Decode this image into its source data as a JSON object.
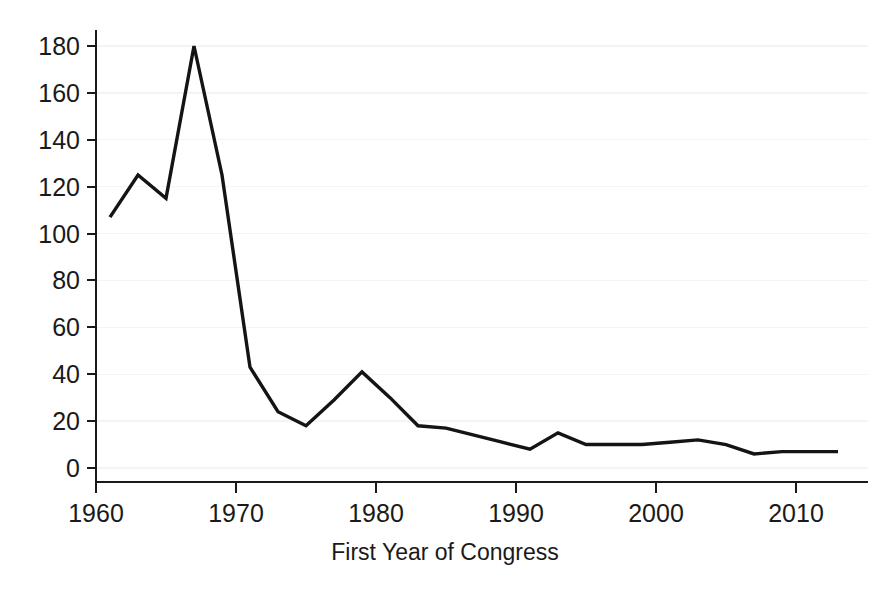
{
  "chart_data": {
    "type": "line",
    "title": "",
    "subtitle": "",
    "xlabel": "First Year of Congress",
    "ylabel": "",
    "grid": true,
    "legend": false,
    "legend_position": "none",
    "line_color": "#141414",
    "background_color": "#ffffff",
    "gridline_color": "#f4f4f4",
    "axis_color": "#1a1a1a",
    "xlim": [
      1960,
      2014
    ],
    "ylim": [
      0,
      185
    ],
    "xticks": [
      1960,
      1970,
      1980,
      1990,
      2000,
      2010
    ],
    "xtick_labels": [
      "1960",
      "1970",
      "1980",
      "1990",
      "2000",
      "2010"
    ],
    "yticks": [
      0,
      20,
      40,
      60,
      80,
      100,
      120,
      140,
      160,
      180
    ],
    "ytick_labels": [
      "0",
      "20",
      "40",
      "60",
      "80",
      "100",
      "120",
      "140",
      "160",
      "180"
    ],
    "series": [
      {
        "name": "bills",
        "x": [
          1961,
          1963,
          1965,
          1967,
          1969,
          1971,
          1973,
          1975,
          1977,
          1979,
          1981,
          1983,
          1985,
          1987,
          1989,
          1991,
          1993,
          1995,
          1997,
          1999,
          2001,
          2003,
          2005,
          2007,
          2009,
          2011,
          2013
        ],
        "values": [
          107,
          125,
          115,
          180,
          125,
          43,
          24,
          18,
          29,
          41,
          30,
          18,
          17,
          14,
          11,
          8,
          15,
          10,
          10,
          10,
          11,
          12,
          10,
          6,
          7,
          7,
          7
        ]
      }
    ]
  }
}
